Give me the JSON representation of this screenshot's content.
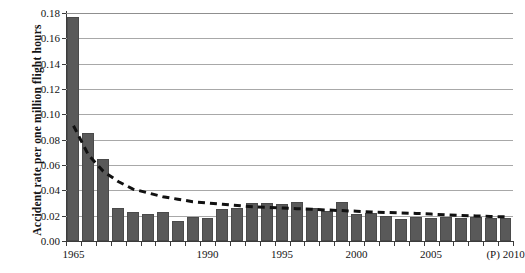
{
  "chart_data": {
    "type": "bar",
    "title": "",
    "xlabel": "",
    "ylabel": "Accident rate per one million flight hours",
    "ylim": [
      0.0,
      0.18
    ],
    "ytick_labels": [
      "0.00",
      "0.02",
      "0.04",
      "0.06",
      "0.08",
      "0.10",
      "0.12",
      "0.14",
      "0.16",
      "0.18"
    ],
    "ytick_values": [
      0.0,
      0.02,
      0.04,
      0.06,
      0.08,
      0.1,
      0.12,
      0.14,
      0.16,
      0.18
    ],
    "grid": true,
    "legend": "none",
    "bar_color": "#595959",
    "gridline_color": "#a8a8a8",
    "axis_color": "#3b3b3b",
    "categories": [
      "1965",
      "1970",
      "1975",
      "1980",
      "1985",
      "1986",
      "1987",
      "1988",
      "1989",
      "1990",
      "1991",
      "1992",
      "1993",
      "1994",
      "1995",
      "1996",
      "1997",
      "1998",
      "1999",
      "2000",
      "2001",
      "2002",
      "2003",
      "2004",
      "2005",
      "2006",
      "2007",
      "2008",
      "2009",
      "(P) 2010"
    ],
    "values": [
      0.177,
      0.085,
      0.065,
      0.026,
      0.023,
      0.021,
      0.023,
      0.016,
      0.019,
      0.018,
      0.025,
      0.026,
      0.03,
      0.03,
      0.029,
      0.031,
      0.026,
      0.024,
      0.031,
      0.021,
      0.022,
      0.02,
      0.017,
      0.019,
      0.018,
      0.019,
      0.018,
      0.019,
      0.018,
      0.018
    ],
    "xtick_labels": [
      {
        "label": "1965",
        "index": 0
      },
      {
        "label": "1990",
        "index": 9
      },
      {
        "label": "1995",
        "index": 14
      },
      {
        "label": "2000",
        "index": 19
      },
      {
        "label": "2005",
        "index": 24
      },
      {
        "label": "(P) 2010",
        "index": 29
      }
    ],
    "trendline": {
      "style": "dashed",
      "color": "#111111",
      "type": "exponential-decay",
      "start_value": 0.091,
      "end_value": 0.019,
      "points": [
        0.091,
        0.068,
        0.055,
        0.047,
        0.041,
        0.038,
        0.035,
        0.033,
        0.031,
        0.03,
        0.029,
        0.028,
        0.027,
        0.0265,
        0.026,
        0.0255,
        0.025,
        0.0245,
        0.024,
        0.0235,
        0.023,
        0.0225,
        0.0222,
        0.0218,
        0.0212,
        0.0207,
        0.0202,
        0.0198,
        0.0194,
        0.019
      ]
    }
  }
}
